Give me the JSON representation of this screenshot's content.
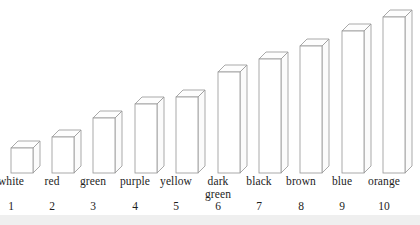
{
  "chart_data": {
    "type": "bar",
    "title": "",
    "subtitle": "",
    "xlabel": "",
    "ylabel": "",
    "grid": false,
    "legend": "none",
    "style": "3d-isometric-outline-bars",
    "categories": [
      "white",
      "red",
      "green",
      "purple",
      "yellow",
      "dark green",
      "black",
      "brown",
      "blue",
      "orange"
    ],
    "category_lines": [
      [
        "white"
      ],
      [
        "red"
      ],
      [
        "green"
      ],
      [
        "purple"
      ],
      [
        "yellow"
      ],
      [
        "dark",
        "green"
      ],
      [
        "black"
      ],
      [
        "brown"
      ],
      [
        "blue"
      ],
      [
        "orange"
      ]
    ],
    "rank_labels": [
      "1",
      "2",
      "3",
      "4",
      "5",
      "6",
      "7",
      "8",
      "9",
      "10"
    ],
    "values": [
      25,
      36,
      55,
      69,
      76,
      101,
      114,
      127,
      142,
      156
    ],
    "ylim": [
      0,
      175
    ],
    "bar_pixel_tops": [
      148,
      137,
      118,
      104,
      97,
      72,
      59,
      46,
      31,
      17
    ],
    "baseline_y": 173,
    "bar_width": 22,
    "bar_depth_x": 7,
    "bar_depth_y": 7,
    "bar_left_positions": [
      11,
      52,
      93,
      135,
      176,
      218,
      259,
      300,
      342,
      383
    ],
    "colors": {
      "background": "#ffffff",
      "bar_face": "#ffffff",
      "bar_outline": "#9a9a9a",
      "text": "#1d1d1d",
      "bottom_band": "#efefef"
    }
  }
}
